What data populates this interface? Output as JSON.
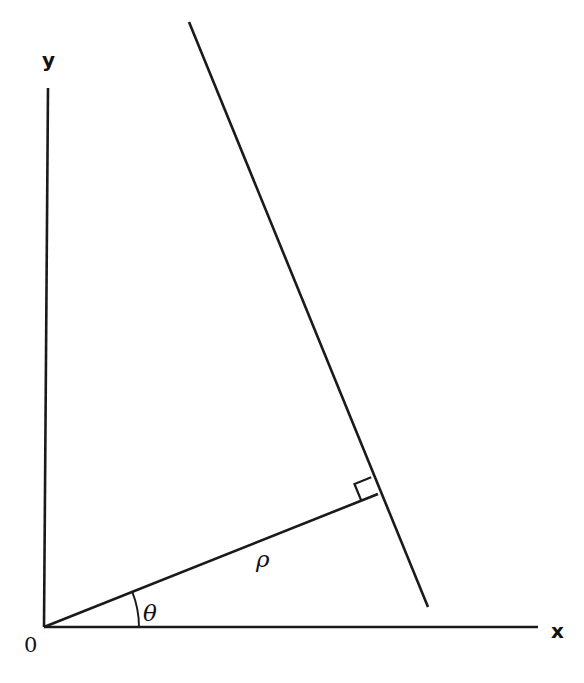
{
  "figure": {
    "type": "geometry-diagram",
    "background_color": "#ffffff",
    "stroke_color": "#1a1a1a",
    "canvas": {
      "width": 584,
      "height": 683
    }
  },
  "labels": {
    "y_axis": "y",
    "x_axis": "x",
    "origin": "0",
    "radius": "ρ",
    "angle": "θ"
  },
  "geometry": {
    "origin": {
      "x": 44,
      "y": 627
    },
    "y_axis": {
      "x1": 48,
      "y1": 88,
      "x2": 44,
      "y2": 627
    },
    "x_axis": {
      "x1": 44,
      "y1": 627,
      "x2": 538,
      "y2": 627
    },
    "line": {
      "x1": 189,
      "y1": 22,
      "x2": 428,
      "y2": 607
    },
    "normal_segment": {
      "x1": 44,
      "y1": 627,
      "x2": 378,
      "y2": 494
    },
    "foot_of_perpendicular": {
      "x": 378,
      "y": 494
    },
    "angle_arc_radius": 95,
    "angle_theta_degrees": 21.7,
    "right_angle_marker_size": 18,
    "stroke_width_axis": 2.6,
    "stroke_width_line": 2.6
  },
  "label_positions": {
    "y_axis": {
      "left": 42,
      "top": 50
    },
    "x_axis": {
      "left": 551,
      "top": 621
    },
    "origin": {
      "left": 24,
      "top": 635
    },
    "radius": {
      "left": 256,
      "top": 548
    },
    "angle": {
      "left": 143,
      "top": 602
    }
  }
}
